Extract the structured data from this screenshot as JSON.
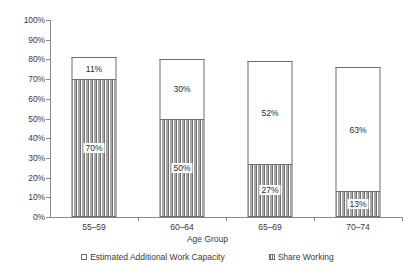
{
  "chart_data": {
    "type": "bar",
    "subtype": "stacked-bar",
    "title": "",
    "xlabel": "Age Group",
    "ylabel": "",
    "ylim": [
      0,
      100
    ],
    "yticks": [
      "0%",
      "10%",
      "20%",
      "30%",
      "40%",
      "50%",
      "60%",
      "70%",
      "80%",
      "90%",
      "100%"
    ],
    "ytick_values": [
      0,
      10,
      20,
      30,
      40,
      50,
      60,
      70,
      80,
      90,
      100
    ],
    "grid": false,
    "legend_position": "bottom",
    "categories": [
      "55–59",
      "60–64",
      "65–69",
      "70–74"
    ],
    "series": [
      {
        "name": "Share Working",
        "values": [
          70,
          50,
          27,
          13
        ],
        "labels": [
          "70%",
          "50%",
          "27%",
          "13%"
        ],
        "fill": "vertical-hatch",
        "color": "#6f6f6f"
      },
      {
        "name": "Estimated Additional Work Capacity",
        "values": [
          11,
          30,
          52,
          63
        ],
        "labels": [
          "11%",
          "30%",
          "52%",
          "63%"
        ],
        "fill": "white",
        "color": "#ffffff"
      }
    ],
    "totals": [
      81,
      80,
      79,
      76
    ]
  },
  "legend": {
    "items": [
      {
        "label": "Estimated Additional Work Capacity",
        "swatch": "white"
      },
      {
        "label": "Share Working",
        "swatch": "vertical-hatch"
      }
    ]
  },
  "colors": {
    "axis": "#8a8a8a",
    "bar_border": "#6e6e6e",
    "text": "#3a3a3a",
    "background": "#ffffff"
  }
}
